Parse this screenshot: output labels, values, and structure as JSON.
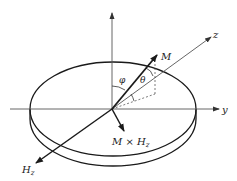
{
  "diagram": {
    "labels": {
      "z_axis": "z",
      "y_axis": "y",
      "magnetization": "M",
      "theta": "θ",
      "phi": "φ",
      "field": "H",
      "field_sub": "z",
      "torque_prefix": "M × H",
      "torque_sub": "z"
    },
    "colors": {
      "stroke": "#1a1a1a",
      "axis": "#555555",
      "background": "#ffffff"
    }
  }
}
